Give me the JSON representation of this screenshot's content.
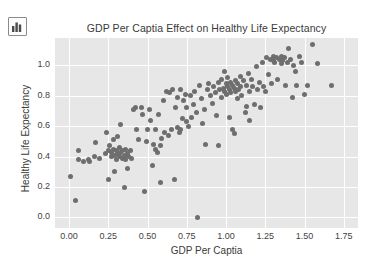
{
  "toolbar": {
    "icon_name": "bar-chart-icon"
  },
  "chart_data": {
    "type": "scatter",
    "title": "GDP Per Captia Effect on Healthy Life Expectancy",
    "xlabel": "GDP Per Captia",
    "ylabel": "Healthy Life Expectancy",
    "xlim": [
      -0.09,
      1.84
    ],
    "ylim": [
      -0.07,
      1.18
    ],
    "xticks": [
      "0.00",
      "0.25",
      "0.50",
      "0.75",
      "1.00",
      "1.25",
      "1.50",
      "1.75"
    ],
    "xtick_values": [
      0.0,
      0.25,
      0.5,
      0.75,
      1.0,
      1.25,
      1.5,
      1.75
    ],
    "yticks": [
      "0.0",
      "0.2",
      "0.4",
      "0.6",
      "0.8",
      "1.0"
    ],
    "ytick_values": [
      0.0,
      0.2,
      0.4,
      0.6,
      0.8,
      1.0
    ],
    "grid": true,
    "legend": false,
    "marker_color": "#6e6e6e",
    "plot_background": "#e7e7e7",
    "gridline_color": "#ffffff",
    "point_count": 172,
    "points": [
      [
        0.01,
        0.27
      ],
      [
        0.04,
        0.11
      ],
      [
        0.06,
        0.44
      ],
      [
        0.06,
        0.38
      ],
      [
        0.09,
        0.37
      ],
      [
        0.12,
        0.38
      ],
      [
        0.13,
        0.37
      ],
      [
        0.16,
        0.4
      ],
      [
        0.17,
        0.49
      ],
      [
        0.19,
        0.39
      ],
      [
        0.23,
        0.42
      ],
      [
        0.24,
        0.56
      ],
      [
        0.25,
        0.44
      ],
      [
        0.25,
        0.25
      ],
      [
        0.26,
        0.47
      ],
      [
        0.27,
        0.43
      ],
      [
        0.27,
        0.4
      ],
      [
        0.28,
        0.51
      ],
      [
        0.28,
        0.45
      ],
      [
        0.29,
        0.41
      ],
      [
        0.29,
        0.3
      ],
      [
        0.3,
        0.44
      ],
      [
        0.3,
        0.38
      ],
      [
        0.31,
        0.53
      ],
      [
        0.31,
        0.42
      ],
      [
        0.32,
        0.46
      ],
      [
        0.32,
        0.4
      ],
      [
        0.33,
        0.43
      ],
      [
        0.33,
        0.61
      ],
      [
        0.34,
        0.39
      ],
      [
        0.34,
        0.44
      ],
      [
        0.35,
        0.41
      ],
      [
        0.35,
        0.2
      ],
      [
        0.36,
        0.45
      ],
      [
        0.36,
        0.38
      ],
      [
        0.37,
        0.42
      ],
      [
        0.37,
        0.32
      ],
      [
        0.38,
        0.4
      ],
      [
        0.39,
        0.44
      ],
      [
        0.4,
        0.39
      ],
      [
        0.41,
        0.71
      ],
      [
        0.42,
        0.72
      ],
      [
        0.43,
        0.58
      ],
      [
        0.44,
        0.51
      ],
      [
        0.46,
        0.72
      ],
      [
        0.47,
        0.68
      ],
      [
        0.48,
        0.17
      ],
      [
        0.49,
        0.5
      ],
      [
        0.5,
        0.58
      ],
      [
        0.51,
        0.71
      ],
      [
        0.52,
        0.64
      ],
      [
        0.53,
        0.34
      ],
      [
        0.54,
        0.48
      ],
      [
        0.55,
        0.45
      ],
      [
        0.55,
        0.58
      ],
      [
        0.56,
        0.43
      ],
      [
        0.57,
        0.68
      ],
      [
        0.58,
        0.23
      ],
      [
        0.58,
        0.47
      ],
      [
        0.59,
        0.52
      ],
      [
        0.6,
        0.77
      ],
      [
        0.61,
        0.56
      ],
      [
        0.62,
        0.83
      ],
      [
        0.63,
        0.54
      ],
      [
        0.64,
        0.82
      ],
      [
        0.65,
        0.58
      ],
      [
        0.66,
        0.84
      ],
      [
        0.67,
        0.25
      ],
      [
        0.68,
        0.72
      ],
      [
        0.69,
        0.59
      ],
      [
        0.69,
        0.79
      ],
      [
        0.7,
        0.56
      ],
      [
        0.71,
        0.84
      ],
      [
        0.71,
        0.58
      ],
      [
        0.72,
        0.65
      ],
      [
        0.73,
        0.77
      ],
      [
        0.74,
        0.81
      ],
      [
        0.75,
        0.63
      ],
      [
        0.75,
        0.72
      ],
      [
        0.76,
        0.6
      ],
      [
        0.77,
        0.8
      ],
      [
        0.78,
        0.66
      ],
      [
        0.79,
        0.74
      ],
      [
        0.8,
        0.83
      ],
      [
        0.81,
        0.69
      ],
      [
        0.82,
        0.0
      ],
      [
        0.83,
        0.87
      ],
      [
        0.84,
        0.78
      ],
      [
        0.85,
        0.62
      ],
      [
        0.86,
        0.71
      ],
      [
        0.87,
        0.48
      ],
      [
        0.88,
        0.84
      ],
      [
        0.89,
        0.88
      ],
      [
        0.9,
        0.8
      ],
      [
        0.91,
        0.75
      ],
      [
        0.92,
        0.86
      ],
      [
        0.93,
        0.82
      ],
      [
        0.94,
        0.67
      ],
      [
        0.95,
        0.47
      ],
      [
        0.95,
        0.89
      ],
      [
        0.96,
        0.84
      ],
      [
        0.97,
        0.91
      ],
      [
        0.97,
        0.79
      ],
      [
        0.98,
        0.85
      ],
      [
        0.99,
        0.96
      ],
      [
        0.99,
        0.83
      ],
      [
        1.0,
        0.88
      ],
      [
        1.0,
        0.81
      ],
      [
        1.01,
        0.86
      ],
      [
        1.01,
        0.92
      ],
      [
        1.02,
        0.84
      ],
      [
        1.02,
        0.66
      ],
      [
        1.03,
        0.89
      ],
      [
        1.03,
        0.82
      ],
      [
        1.04,
        0.87
      ],
      [
        1.04,
        0.58
      ],
      [
        1.05,
        0.85
      ],
      [
        1.05,
        0.55
      ],
      [
        1.06,
        0.9
      ],
      [
        1.06,
        0.83
      ],
      [
        1.07,
        0.88
      ],
      [
        1.07,
        0.78
      ],
      [
        1.08,
        0.84
      ],
      [
        1.09,
        0.93
      ],
      [
        1.09,
        0.86
      ],
      [
        1.1,
        0.8
      ],
      [
        1.11,
        0.9
      ],
      [
        1.12,
        0.69
      ],
      [
        1.13,
        0.87
      ],
      [
        1.14,
        0.95
      ],
      [
        1.15,
        0.83
      ],
      [
        1.15,
        0.64
      ],
      [
        1.16,
        0.91
      ],
      [
        1.17,
        0.86
      ],
      [
        1.18,
        0.74
      ],
      [
        1.19,
        0.99
      ],
      [
        1.2,
        0.84
      ],
      [
        1.21,
        0.89
      ],
      [
        1.22,
        0.72
      ],
      [
        1.23,
        1.02
      ],
      [
        1.24,
        0.86
      ],
      [
        1.25,
        0.83
      ],
      [
        1.26,
        1.05
      ],
      [
        1.27,
        0.94
      ],
      [
        1.28,
        1.04
      ],
      [
        1.29,
        0.88
      ],
      [
        1.3,
        1.03
      ],
      [
        1.3,
        1.06
      ],
      [
        1.31,
        1.02
      ],
      [
        1.32,
        1.05
      ],
      [
        1.33,
        0.91
      ],
      [
        1.34,
        1.04
      ],
      [
        1.35,
        1.06
      ],
      [
        1.35,
        1.01
      ],
      [
        1.36,
        1.03
      ],
      [
        1.37,
        1.05
      ],
      [
        1.38,
        0.87
      ],
      [
        1.39,
        1.02
      ],
      [
        1.4,
        1.11
      ],
      [
        1.41,
        1.04
      ],
      [
        1.42,
        0.79
      ],
      [
        1.43,
        1.0
      ],
      [
        1.44,
        0.96
      ],
      [
        1.45,
        0.87
      ],
      [
        1.47,
        1.06
      ],
      [
        1.48,
        1.02
      ],
      [
        1.5,
        0.81
      ],
      [
        1.52,
        0.87
      ],
      [
        1.55,
        1.14
      ],
      [
        1.58,
        1.01
      ],
      [
        1.67,
        0.87
      ],
      [
        1.13,
        0.73
      ]
    ]
  }
}
